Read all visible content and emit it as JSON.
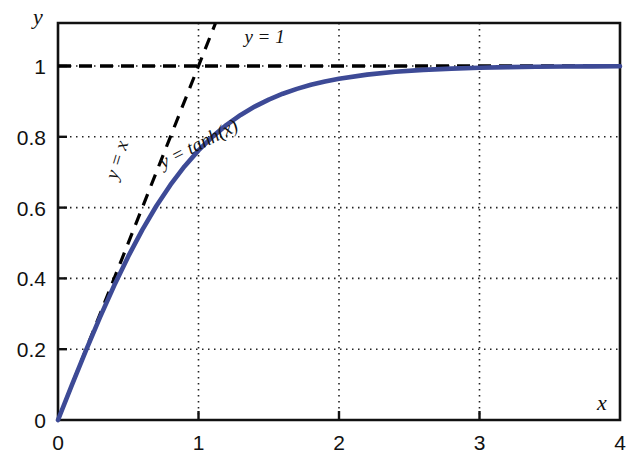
{
  "chart_data": {
    "type": "line",
    "title": "",
    "xlabel": "x",
    "ylabel": "y",
    "xlim": [
      0,
      4
    ],
    "ylim": [
      0,
      1.12
    ],
    "grid": true,
    "legend_position": "inline-annotations",
    "xticks": [
      "0",
      "1",
      "2",
      "3",
      "4"
    ],
    "xtick_values": [
      0,
      1,
      2,
      3,
      4
    ],
    "yticks": [
      "0",
      "0.2",
      "0.4",
      "0.6",
      "0.8",
      "1"
    ],
    "ytick_values": [
      0,
      0.2,
      0.4,
      0.6,
      0.8,
      1
    ],
    "series": [
      {
        "name": "y = tanh(x)",
        "style": "solid",
        "color": "#3d4a96",
        "x": [
          0,
          0.1,
          0.2,
          0.3,
          0.4,
          0.5,
          0.6,
          0.7,
          0.8,
          0.9,
          1.0,
          1.1,
          1.2,
          1.3,
          1.4,
          1.5,
          1.6,
          1.7,
          1.8,
          1.9,
          2.0,
          2.2,
          2.4,
          2.6,
          2.8,
          3.0,
          3.2,
          3.4,
          3.6,
          3.8,
          4.0
        ],
        "values": [
          0.0,
          0.0997,
          0.1974,
          0.2913,
          0.3799,
          0.4621,
          0.537,
          0.6044,
          0.664,
          0.7163,
          0.7616,
          0.8005,
          0.8337,
          0.8617,
          0.8854,
          0.9051,
          0.9217,
          0.9354,
          0.9468,
          0.9562,
          0.964,
          0.9757,
          0.9837,
          0.989,
          0.9926,
          0.9951,
          0.9967,
          0.9978,
          0.9985,
          0.999,
          0.9993
        ]
      },
      {
        "name": "y = x",
        "style": "dashed",
        "color": "#000000",
        "x": [
          0,
          1.12
        ],
        "values": [
          0,
          1.12
        ]
      },
      {
        "name": "y = 1",
        "style": "dashed",
        "color": "#000000",
        "x": [
          0,
          4
        ],
        "values": [
          1,
          1
        ]
      }
    ],
    "annotations": [
      {
        "text": "y = 1",
        "x": 1.47,
        "y": 1.065,
        "rotation": 0
      },
      {
        "text": "y = x",
        "x": 0.46,
        "y": 0.73,
        "rotation": -73
      },
      {
        "text": "y = tanh(x)",
        "x": 1.02,
        "y": 0.765,
        "rotation": -27
      }
    ]
  },
  "axis": {
    "x_name": "x",
    "y_name": "y"
  }
}
